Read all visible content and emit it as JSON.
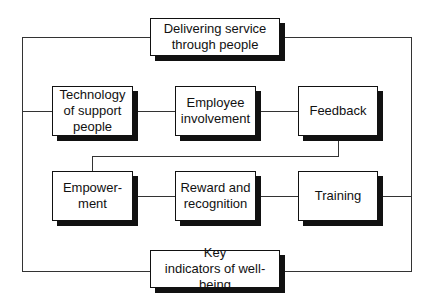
{
  "diagram": {
    "top_box": "Delivering service\nthrough people",
    "bottom_box": "Key\nindicators of well-being",
    "row1": [
      "Technology\nof support\npeople",
      "Employee\ninvolvement",
      "Feedback"
    ],
    "row2": [
      "Empower-\nment",
      "Reward and\nrecognition",
      "Training"
    ]
  },
  "colors": {
    "line": "#333333",
    "box_border": "#111111",
    "shadow": "#111111",
    "background": "#ffffff"
  }
}
